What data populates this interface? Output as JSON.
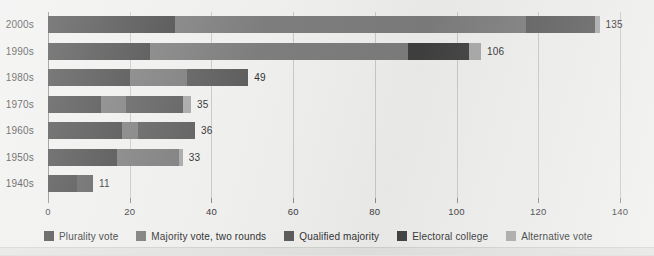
{
  "chart_data": {
    "type": "bar",
    "orientation": "horizontal",
    "stacked": true,
    "title": "",
    "xlabel": "",
    "ylabel": "",
    "xlim": [
      0,
      140
    ],
    "xticks": [
      0,
      20,
      40,
      60,
      80,
      100,
      120,
      140
    ],
    "xtick_labels": [
      "0",
      "20",
      "40",
      "60",
      "80",
      "100",
      "120",
      "140"
    ],
    "grid": true,
    "grid_axis": "x",
    "legend_position": "bottom",
    "categories": [
      "2000s",
      "1990s",
      "1980s",
      "1970s",
      "1960s",
      "1950s",
      "1940s"
    ],
    "series": [
      {
        "name": "Plurality vote",
        "color": "#4a4a4a",
        "values": [
          31,
          25,
          20,
          13,
          18,
          17,
          7
        ]
      },
      {
        "name": "Majority vote, two rounds",
        "color": "#7d7d7d",
        "values": [
          86,
          63,
          14,
          6,
          4,
          15,
          0
        ]
      },
      {
        "name": "Qualified majority",
        "color": "#5e5e5e",
        "values": [
          17,
          0,
          15,
          14,
          14,
          0,
          4
        ]
      },
      {
        "name": "Electoral college",
        "color": "#404040",
        "values": [
          0,
          15,
          0,
          0,
          0,
          0,
          0
        ]
      },
      {
        "name": "Alternative vote",
        "color": "#a8a8a8",
        "values": [
          1,
          3,
          0,
          2,
          0,
          1,
          0
        ]
      }
    ],
    "totals": [
      135,
      106,
      49,
      35,
      36,
      33,
      11
    ],
    "total_labels": [
      "135",
      "106",
      "49",
      "35",
      "36",
      "33",
      "11"
    ]
  },
  "legend": {
    "items": [
      {
        "label": "Plurality vote",
        "color": "#4a4a4a"
      },
      {
        "label": "Majority vote, two rounds",
        "color": "#7d7d7d"
      },
      {
        "label": "Qualified majority",
        "color": "#5e5e5e"
      },
      {
        "label": "Electoral college",
        "color": "#404040"
      },
      {
        "label": "Alternative vote",
        "color": "#a8a8a8"
      }
    ]
  },
  "colors": {
    "background": "#efefee",
    "grid": "#c9c9c7",
    "axis": "#8d8d8b",
    "text": "#3c3c3c"
  }
}
